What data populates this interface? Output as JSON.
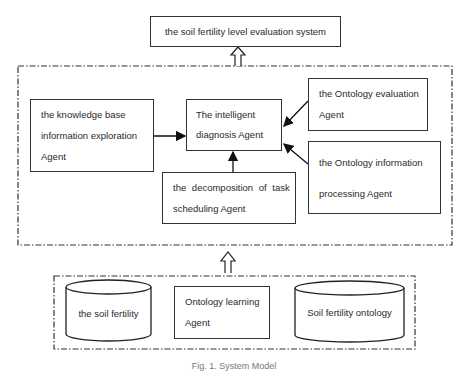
{
  "diagram": {
    "top_system": {
      "label": "the soil fertility level evaluation system"
    },
    "agent_layer": {
      "knowledge_base_agent": {
        "lines": [
          "the knowledge base",
          "information exploration",
          "Agent"
        ]
      },
      "diagnosis_agent": {
        "lines": [
          "The intelligent",
          "diagnosis Agent"
        ]
      },
      "evaluation_agent": {
        "lines": [
          "the Ontology evaluation",
          "Agent"
        ]
      },
      "processing_agent": {
        "lines": [
          "the Ontology information",
          "processing Agent"
        ]
      },
      "decomposition_agent": {
        "lines": [
          "the decomposition of task",
          "scheduling Agent"
        ]
      }
    },
    "data_layer": {
      "soil_fertility_db": {
        "label": "the soil fertility"
      },
      "ontology_learning_agent": {
        "lines": [
          "Ontology learning",
          "Agent"
        ]
      },
      "soil_fertility_ontology_db": {
        "label": "Soil fertility ontology"
      }
    },
    "caption": "Fig. 1. System Model",
    "edges": [
      {
        "from": "knowledge_base_agent",
        "to": "diagnosis_agent"
      },
      {
        "from": "evaluation_agent",
        "to": "diagnosis_agent"
      },
      {
        "from": "processing_agent",
        "to": "diagnosis_agent"
      },
      {
        "from": "decomposition_agent",
        "to": "diagnosis_agent"
      },
      {
        "from": "agent_layer",
        "to": "top_system",
        "style": "hollow"
      },
      {
        "from": "data_layer",
        "to": "agent_layer",
        "style": "hollow"
      }
    ]
  }
}
